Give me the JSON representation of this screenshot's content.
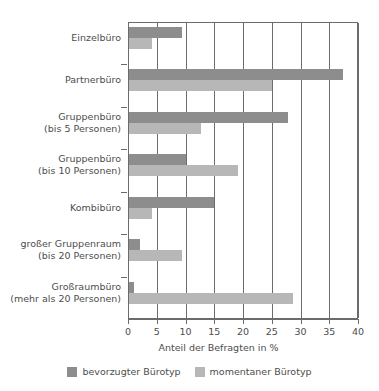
{
  "chart_data": {
    "type": "bar",
    "orientation": "horizontal",
    "title": "",
    "xlabel": "Anteil der Befragten in %",
    "ylabel": "",
    "xlim": [
      0,
      40
    ],
    "xticks": [
      0,
      5,
      10,
      15,
      20,
      25,
      30,
      35,
      40
    ],
    "grid": true,
    "grid_axis": "x",
    "legend_position": "bottom",
    "categories": [
      "Einzelbüro",
      "Partnerbüro",
      "Gruppenbüro\n(bis 5 Personen)",
      "Gruppenbüro\n(bis 10 Personen)",
      "Kombibüro",
      "großer Gruppenraum\n(bis 20 Personen)",
      "Großraumbüro\n(mehr als 20 Personen)"
    ],
    "category_lines": [
      [
        "Einzelbüro"
      ],
      [
        "Partnerbüro"
      ],
      [
        "Gruppenbüro",
        "(bis 5 Personen)"
      ],
      [
        "Gruppenbüro",
        "(bis 10 Personen)"
      ],
      [
        "Kombibüro"
      ],
      [
        "großer Gruppenraum",
        "(bis 20 Personen)"
      ],
      [
        "Großraumbüro",
        "(mehr als 20 Personen)"
      ]
    ],
    "series": [
      {
        "name": "bevorzugter Bürotyp",
        "color": "#8d8d8d",
        "values": [
          9.2,
          37.2,
          27.6,
          9.9,
          14.8,
          1.9,
          0.9
        ]
      },
      {
        "name": "momentaner Bürotyp",
        "color": "#b7b7b7",
        "values": [
          4.0,
          24.9,
          12.5,
          19.0,
          4.0,
          9.2,
          28.5
        ]
      }
    ]
  },
  "legend": {
    "items": [
      {
        "label": "bevorzugter Bürotyp",
        "color": "#8d8d8d"
      },
      {
        "label": "momentaner Bürotyp",
        "color": "#b7b7b7"
      }
    ]
  },
  "axis": {
    "x_title": "Anteil der Befragten in %",
    "tick_labels": [
      "0",
      "5",
      "10",
      "15",
      "20",
      "25",
      "30",
      "35",
      "40"
    ]
  },
  "colors": {
    "preferred": "#8d8d8d",
    "current": "#b7b7b7",
    "axis": "#6b6b6b",
    "text": "#4d4d4d",
    "background": "#ffffff"
  }
}
